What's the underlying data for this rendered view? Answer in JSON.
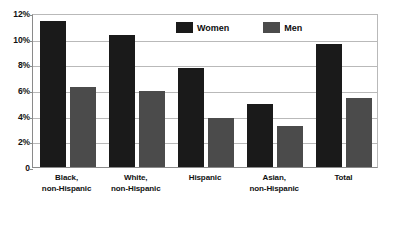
{
  "chart_data": {
    "type": "bar",
    "title": "",
    "subtitle": "",
    "xlabel": "",
    "ylabel": "",
    "ylim": [
      0,
      12
    ],
    "grid": true,
    "legend_position": "top-center",
    "categories": [
      "Black, non-Hispanic",
      "White, non-Hispanic",
      "Hispanic",
      "Asian, non-Hispanic",
      "Total"
    ],
    "category_lines": [
      [
        "Black,",
        "non-Hispanic"
      ],
      [
        "White,",
        "non-Hispanic"
      ],
      [
        "Hispanic",
        ""
      ],
      [
        "Asian,",
        "non-Hispanic"
      ],
      [
        "Total",
        ""
      ]
    ],
    "series": [
      {
        "name": "Women",
        "color": "#1a1a1a",
        "values": [
          11.4,
          10.3,
          7.7,
          4.9,
          9.6
        ]
      },
      {
        "name": "Men",
        "color": "#4b4b4b",
        "values": [
          6.2,
          5.9,
          3.8,
          3.2,
          5.4
        ]
      }
    ],
    "y_ticks": [
      {
        "value": 12,
        "label": "12%"
      },
      {
        "value": 10,
        "label": "10%"
      },
      {
        "value": 8,
        "label": "8%"
      },
      {
        "value": 6,
        "label": "6%"
      },
      {
        "value": 4,
        "label": "4%"
      },
      {
        "value": 2,
        "label": "2%"
      },
      {
        "value": 0,
        "label": "0"
      }
    ]
  },
  "legend": {
    "items": [
      {
        "label": "Women",
        "swatch": "women-swatch"
      },
      {
        "label": "Men",
        "swatch": "men-swatch"
      }
    ]
  }
}
